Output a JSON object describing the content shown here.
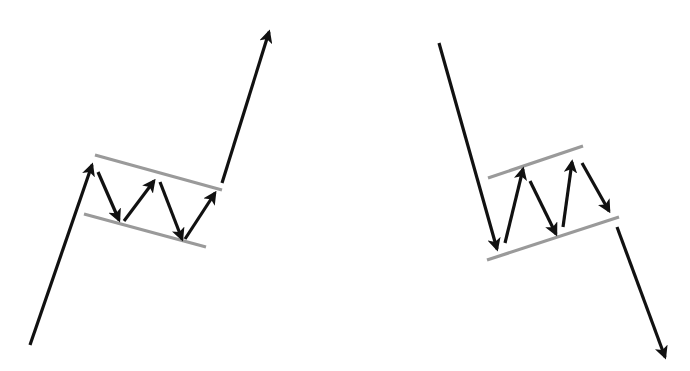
{
  "diagram": {
    "type": "flag-patterns",
    "colors": {
      "background": "#ffffff",
      "arrow": "#111111",
      "channel": "#9a9a9a"
    },
    "stroke": {
      "arrow_width": 3.2,
      "channel_width": 3.2
    },
    "patterns": [
      {
        "name": "bull-flag",
        "pole": {
          "x1": 30,
          "y1": 345,
          "x2": 92,
          "y2": 165
        },
        "channel_upper": {
          "x1": 95,
          "y1": 155,
          "x2": 222,
          "y2": 190
        },
        "channel_lower": {
          "x1": 84,
          "y1": 214,
          "x2": 206,
          "y2": 247
        },
        "zigzag": [
          {
            "x1": 98,
            "y1": 172,
            "x2": 119,
            "y2": 220,
            "direction": "down"
          },
          {
            "x1": 124,
            "y1": 221,
            "x2": 154,
            "y2": 181,
            "direction": "up"
          },
          {
            "x1": 160,
            "y1": 182,
            "x2": 182,
            "y2": 239,
            "direction": "down"
          },
          {
            "x1": 185,
            "y1": 239,
            "x2": 215,
            "y2": 193,
            "direction": "up"
          }
        ],
        "breakout": {
          "x1": 222,
          "y1": 183,
          "x2": 269,
          "y2": 32,
          "direction": "up"
        }
      },
      {
        "name": "bear-flag",
        "pole": {
          "x1": 439,
          "y1": 43,
          "x2": 497,
          "y2": 249
        },
        "channel_upper": {
          "x1": 488,
          "y1": 178,
          "x2": 583,
          "y2": 146
        },
        "channel_lower": {
          "x1": 487,
          "y1": 260,
          "x2": 619,
          "y2": 217
        },
        "zigzag": [
          {
            "x1": 505,
            "y1": 243,
            "x2": 523,
            "y2": 169,
            "direction": "up"
          },
          {
            "x1": 530,
            "y1": 181,
            "x2": 556,
            "y2": 234,
            "direction": "down"
          },
          {
            "x1": 563,
            "y1": 227,
            "x2": 572,
            "y2": 162,
            "direction": "up"
          },
          {
            "x1": 582,
            "y1": 163,
            "x2": 609,
            "y2": 211,
            "direction": "down"
          }
        ],
        "breakout": {
          "x1": 617,
          "y1": 227,
          "x2": 665,
          "y2": 357,
          "direction": "down"
        }
      }
    ]
  }
}
